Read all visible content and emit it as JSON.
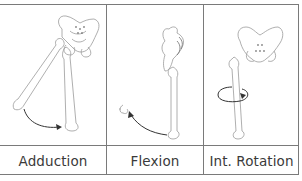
{
  "figure": {
    "panels": [
      {
        "label": "Adduction",
        "motion": "adduction",
        "icon": "hip-adduction-illustration"
      },
      {
        "label": "Flexion",
        "motion": "flexion",
        "icon": "hip-flexion-illustration"
      },
      {
        "label": "Int. Rotation",
        "motion": "internal-rotation",
        "icon": "hip-internal-rotation-illustration"
      }
    ],
    "colors": {
      "border": "#7a7a7a",
      "bone_outline": "#9a9a9a",
      "arrow": "#333333",
      "label_text": "#3a3a3a"
    }
  }
}
